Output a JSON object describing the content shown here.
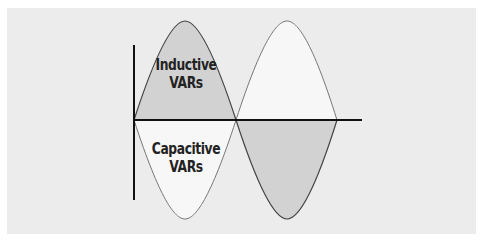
{
  "diagram": {
    "labels": {
      "inductive_line1": "Inductive",
      "inductive_line2": "VARs",
      "capacitive_line1": "Capacitive",
      "capacitive_line2": "VARs"
    },
    "colors": {
      "background": "#ececec",
      "dark_fill": "#d2d2d2",
      "light_fill": "#f7f7f7",
      "stroke": "#333333"
    },
    "waves": [
      {
        "name": "inductive-wave",
        "description": "positive first half-cycle (shaded)"
      },
      {
        "name": "capacitive-wave",
        "description": "negative first half-cycle (light)"
      }
    ]
  }
}
